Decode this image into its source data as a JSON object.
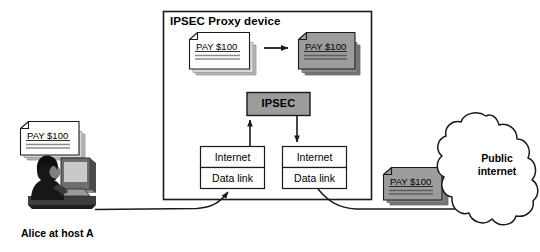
{
  "diagram": {
    "title_visible": false,
    "proxy_box": {
      "label": "IPSEC Proxy device",
      "name": "ipsec-proxy-device"
    },
    "documents": {
      "alice_plain": {
        "label": "PAY $100",
        "state": "plaintext",
        "color": "#ffffff"
      },
      "proxy_plain": {
        "label": "PAY $100",
        "state": "plaintext",
        "color": "#ffffff"
      },
      "proxy_cipher": {
        "label": "PAY $100",
        "state": "encrypted",
        "color": "#9c9c9c"
      },
      "wire_cipher": {
        "label": "PAY $100",
        "state": "encrypted",
        "color": "#9c9c9c"
      }
    },
    "ipsec_module": {
      "label": "IPSEC",
      "fill": "#9c9c9c"
    },
    "stack_left": {
      "name": "protocol-stack-left",
      "layers": [
        "Internet",
        "Data link"
      ]
    },
    "stack_right": {
      "name": "protocol-stack-right",
      "layers": [
        "Internet",
        "Data link"
      ]
    },
    "cloud": {
      "line1": "Public",
      "line2": "internet"
    },
    "host": {
      "label": "Alice at host A",
      "icon": "person-at-computer-icon"
    },
    "arrows": {
      "transform_arrow": "plaintext-to-ciphertext",
      "up_arrow": "datalink-to-ipsec",
      "down_arrow": "ipsec-to-datalink",
      "alice_to_proxy": "alice-to-proxy-link",
      "proxy_to_cloud": "proxy-to-internet-link"
    },
    "colors": {
      "stroke": "#1a1a1a",
      "gray_fill": "#9c9c9c",
      "shadow": "#b0b0b0",
      "white_fill": "#ffffff",
      "background": "#ffffff"
    }
  }
}
